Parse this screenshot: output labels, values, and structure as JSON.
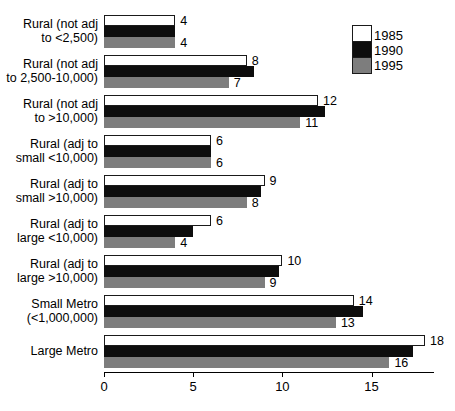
{
  "chart_data": {
    "type": "bar",
    "orientation": "horizontal",
    "title": "",
    "subtitle": "",
    "xlabel": "",
    "ylabel": "",
    "xlim": [
      0,
      18.5
    ],
    "xticks": [
      0,
      5,
      10,
      15
    ],
    "xtick_labels": [
      "0",
      "5",
      "10",
      "15"
    ],
    "grid": false,
    "legend_position": "top-right",
    "categories": [
      "Rural (not adj\nto <2,500)",
      "Rural (not adj\nto 2,500-10,000)",
      "Rural (not adj\nto >10,000)",
      "Rural (adj to\nsmall <10,000)",
      "Rural (adj to\nsmall >10,000)",
      "Rural (adj to\nlarge <10,000)",
      "Rural (adj to\nlarge >10,000)",
      "Small Metro\n(<1,000,000)",
      "Large Metro"
    ],
    "series": [
      {
        "name": "1985",
        "color": "#ffffff",
        "values": [
          4,
          8,
          12,
          6,
          9,
          6,
          10,
          14,
          18
        ],
        "labels": [
          "4",
          "8",
          "12",
          "6",
          "9",
          "6",
          "10",
          "14",
          "18"
        ],
        "labels_shown": true
      },
      {
        "name": "1990",
        "color": "#0d0d0d",
        "values": [
          4,
          8.4,
          12.4,
          6,
          8.8,
          5,
          9.8,
          14.5,
          17.3
        ],
        "labels": [
          "",
          "",
          "",
          "",
          "",
          "",
          "",
          "",
          ""
        ],
        "labels_shown": false
      },
      {
        "name": "1995",
        "color": "#7d7d7d",
        "values": [
          4,
          7,
          11,
          6,
          8,
          4,
          9,
          13,
          16
        ],
        "labels": [
          "4",
          "7",
          "11",
          "6",
          "8",
          "4",
          "9",
          "13",
          "16"
        ],
        "labels_shown": true
      }
    ]
  },
  "legend": {
    "entries": [
      {
        "label": "1985",
        "color": "#ffffff"
      },
      {
        "label": "1990",
        "color": "#0d0d0d"
      },
      {
        "label": "1995",
        "color": "#7d7d7d"
      }
    ]
  }
}
